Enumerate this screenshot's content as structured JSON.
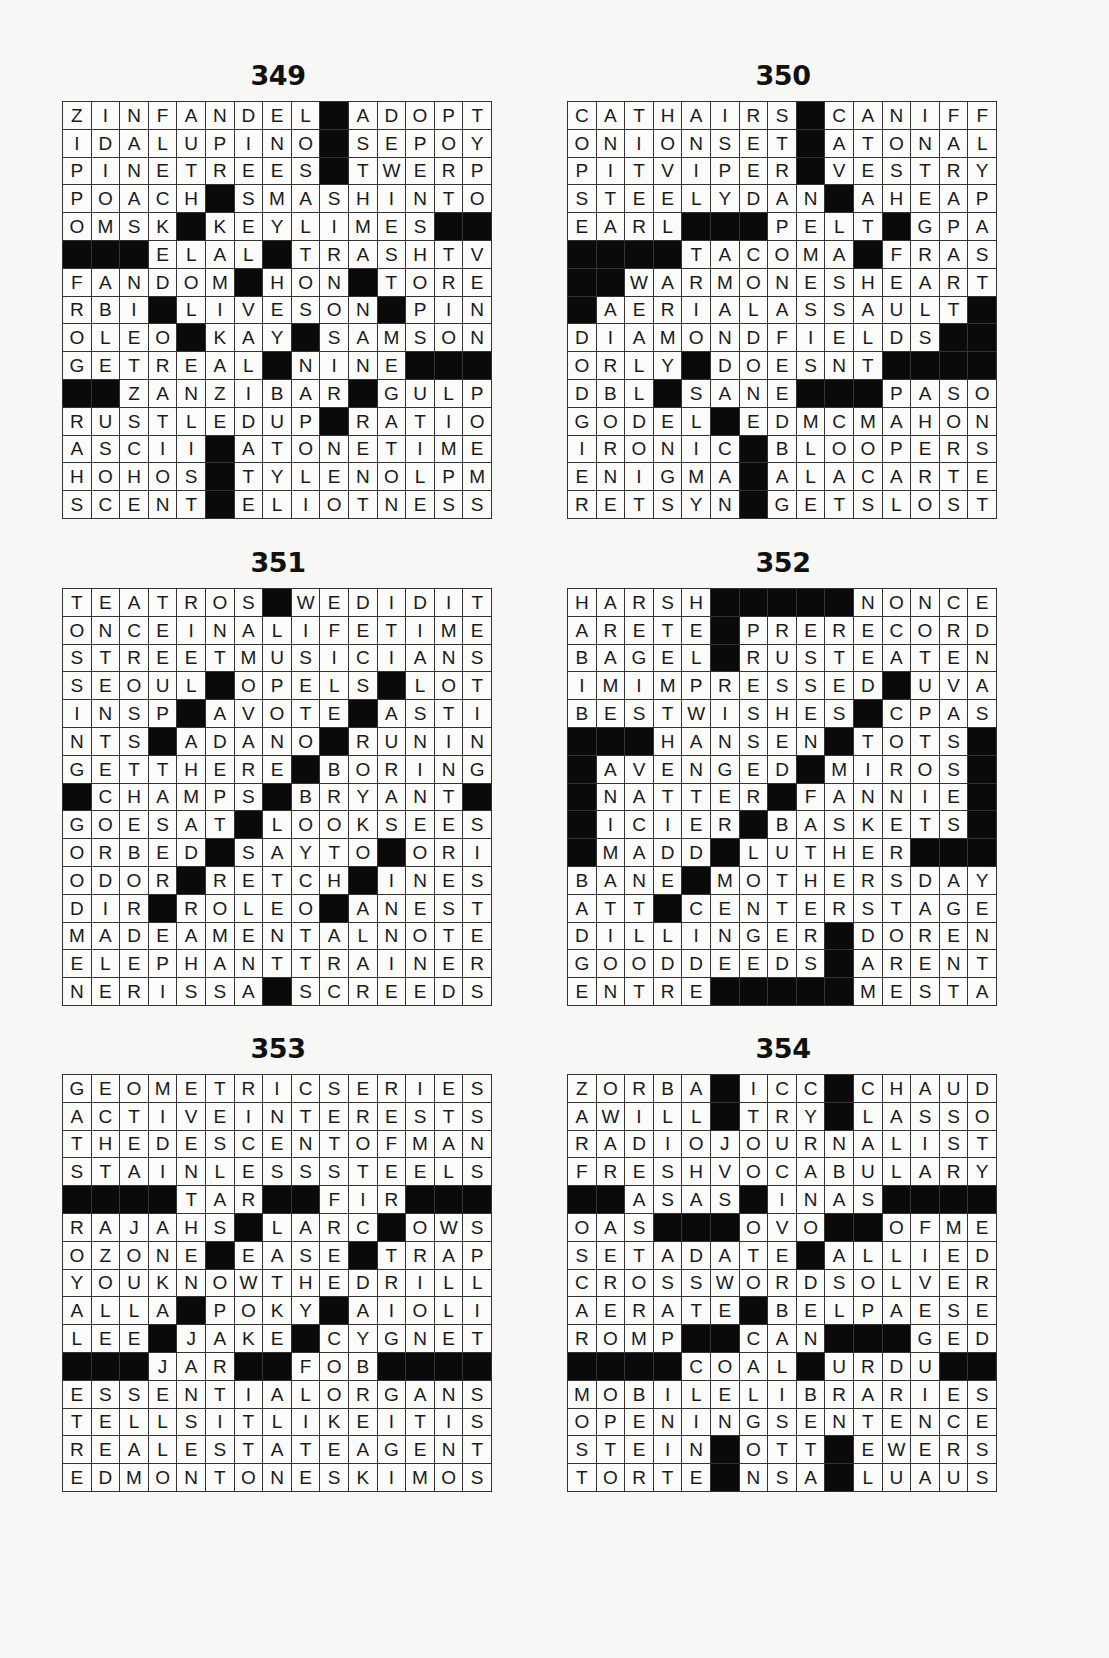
{
  "puzzles": [
    {
      "number": "349",
      "rows": [
        "ZINFANDEL#ADOPT",
        "IDALUPINO#SEPOY",
        "PINETREES#TWERP",
        "POACH#SMASHINTO",
        "OMSK#KEYLIMES##",
        "###ELAL#TRASHTV",
        "FANDOM#HON#TORE",
        "RBI#LIVESON#PIN",
        "OLEO#KAY#SAMSON",
        "GETREAL#NINE###",
        "##ZANZIBAR#GULP",
        "RUSTLEDUP#RATIO",
        "ASCII#ATONETIME",
        "HOHOS#TYLENOLPM",
        "SCENT#ELIOTNESS"
      ]
    },
    {
      "number": "350",
      "rows": [
        "CATHAIRS#CANIFF",
        "ONIONSET#ATONAL",
        "PITVIPER#VESTRY",
        "STEELYDAN#AHEAP",
        "EARL###PELT#GPA",
        "####TACOMA#FRAS",
        "##WARMONESHEART",
        "#AERIALASSAULT#",
        "DIAMONDFIELDS##",
        "ORLY#DOESNT####",
        "DBL#SANE###PASO",
        "GODEL#EDMCMAHON",
        "IRONIC#BLOOPERS",
        "ENIGMA#ALACARTE",
        "RETSYN#GETSLOST"
      ]
    },
    {
      "number": "351",
      "rows": [
        "TEATROS#WEDIDIT",
        "ONCEINALIFETIME",
        "STREETMUSICIANS",
        "SEOUL#OPELS#LOT",
        "INSP#AVOTE#ASTI",
        "NTS#ADANO#RUNIN",
        "GETTHERE#BORING",
        "#CHAMPS#BRYANT#",
        "GOESAT#LOOKSEES",
        "ORBED#SAYTO#ORI",
        "ODOR#RETCH#INES",
        "DIR#ROLEO#ANEST",
        "MADEAMENTALNOTE",
        "ELEPHANTTRAINER",
        "NERISSA#SCREEDS"
      ]
    },
    {
      "number": "352",
      "rows": [
        "HARSH#####NONCE",
        "ARETE#PRERECORD",
        "BAGEL#RUSTEATEN",
        "IMIMPRESSED#UVA",
        "BESTWISHES#CPAS",
        "###HANSEN#TOTS#",
        "#AVENGED#MIROS#",
        "#NATTER#FANNIE#",
        "#ICIER#BASKETS#",
        "#MADD#LUTHER###",
        "BANE#MOTHERSDAY",
        "ATT#CENTERSTAGE",
        "DILLINGER#DOREN",
        "GOODDEEDS#ARENT",
        "ENTRE#####MESTA"
      ]
    },
    {
      "number": "353",
      "rows": [
        "GEOMETRICSERIES",
        "ACTIVEINTERESTS",
        "THEDESCENTOFMAN",
        "STAINLESSSTEELS",
        "####TAR##FIR###",
        "RAJAHS#LARC#OWS",
        "OZONE#EASE#TRAP",
        "YOUKNOWTHEDRILL",
        "ALLA#POKY#AIOLI",
        "LEE#JAKE#CYGNET",
        "###JAR##FOB####",
        "ESSENTIALORGANS",
        "TELLSITLIKEITIS",
        "REALESTATEAGENT",
        "EDMONTONESKIMOS"
      ]
    },
    {
      "number": "354",
      "rows": [
        "ZORBA#ICC#CHAUD",
        "AWILL#TRY#LASSO",
        "RADIOJOURNALIST",
        "FRESHVOCABULARY",
        "##ASAS#INAS####",
        "OAS###OVO##OFME",
        "SETADATE#ALLIED",
        "CROSSWORDSOLVER",
        "AERATE#BELPAESE",
        "ROMP##CAN###GED",
        "####COAL#URDU##",
        "MOBILELIBRARIES",
        "OPENINGSENTENCE",
        "STEIN#OTT#EWERS",
        "TORTE#NSA#LUAUS"
      ]
    }
  ],
  "colors": {
    "page_background": "#f7f7f5",
    "cell_fill": "#fbfbfa",
    "black_square": "#0a0a0a",
    "grid_line": "#333333",
    "text": "#1a1a1a"
  }
}
